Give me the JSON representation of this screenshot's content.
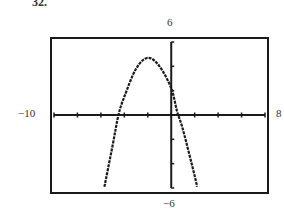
{
  "figure": {
    "cropped_label": "32.",
    "ymax_label": "6",
    "ymin_label": "−6",
    "xmin_label": "−10",
    "xmax_label": "8"
  },
  "chart_data": {
    "type": "line",
    "title": "",
    "xlabel": "",
    "ylabel": "",
    "xlim": [
      -10,
      8
    ],
    "ylim": [
      -6,
      6
    ],
    "xscale": 2,
    "yscale": 2,
    "grid": false,
    "legend": null,
    "series": [
      {
        "name": "parabola (opens downward)",
        "style": "dashed-pixel",
        "x": [
          -5.7,
          -5,
          -4.5,
          -4,
          -3,
          -2,
          -1,
          0,
          0.5,
          1,
          2,
          2.2
        ],
        "y": [
          -5.9,
          -2.5,
          0,
          1.5,
          3.8,
          4.7,
          4.0,
          2.2,
          0.3,
          -1.2,
          -5.0,
          -5.9
        ]
      }
    ],
    "annotations": [
      {
        "text": "6",
        "position": "top (Ymax)"
      },
      {
        "text": "−6",
        "position": "bottom (Ymin)"
      },
      {
        "text": "−10",
        "position": "left (Xmin)"
      },
      {
        "text": "8",
        "position": "right (Xmax)"
      }
    ]
  }
}
